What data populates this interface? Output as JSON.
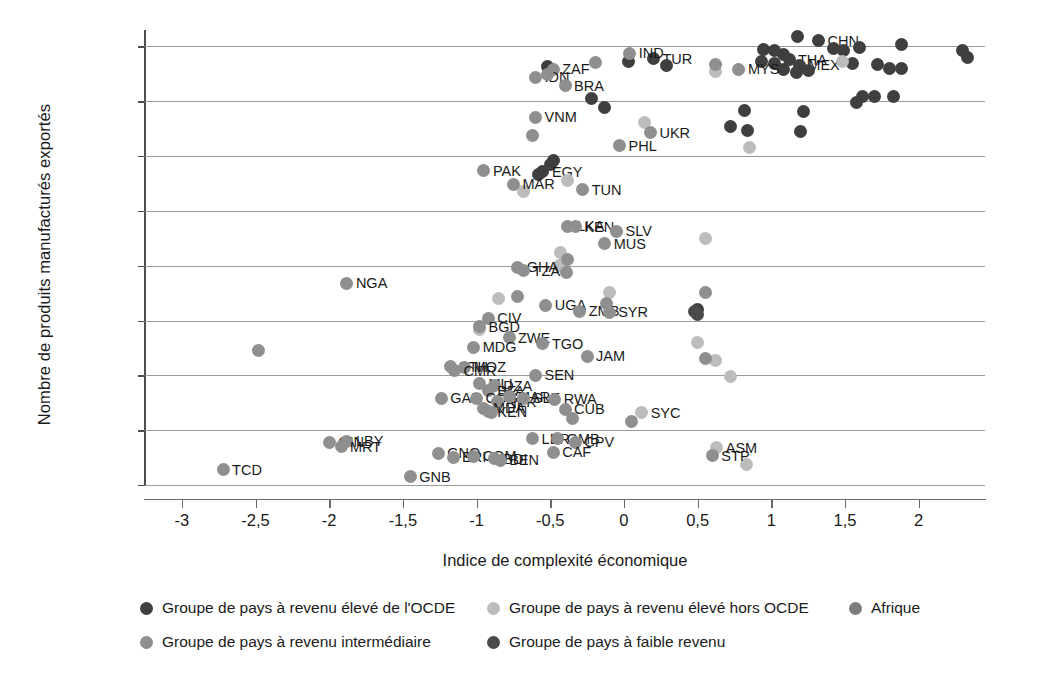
{
  "chart_data": {
    "type": "scatter",
    "title": "",
    "xlabel": "Indice de complexité économique",
    "ylabel": "Nombre de produits manufacturés exportés",
    "xlim": [
      -3.25,
      2.45
    ],
    "ylim": [
      0,
      4150
    ],
    "xticks": [
      "-3",
      "-2,5",
      "-2",
      "-1,5",
      "-1",
      "-0,5",
      "0",
      "0,5",
      "1",
      "1,5",
      "2"
    ],
    "xtick_values": [
      -3,
      -2.5,
      -2,
      -1.5,
      -1,
      -0.5,
      0,
      0.5,
      1,
      1.5,
      2
    ],
    "yticks": [
      "0",
      "500",
      "1000",
      "1500",
      "2000",
      "2500",
      "3000",
      "3500",
      "4000"
    ],
    "ytick_values": [
      0,
      500,
      1000,
      1500,
      2000,
      2500,
      3000,
      3500,
      4000
    ],
    "grid": "horizontal",
    "legend_position": "bottom",
    "colors": {
      "high_income_oecd": "#3f3f3f",
      "high_income_non_oecd": "#bcbcbc",
      "africa": "#7d7d7d",
      "middle_income": "#8f8f8f",
      "low_income": "#4a4a4a"
    },
    "series": [
      {
        "name": "Groupe de pays à revenu élevé de l'OCDE",
        "key": "high_income_oecd",
        "color": "#3f3f3f",
        "points": [
          {
            "label": "",
            "x": 1.18,
            "y": 4090
          },
          {
            "label": "CHN",
            "x": 1.32,
            "y": 4050
          },
          {
            "label": "",
            "x": 0.95,
            "y": 3975
          },
          {
            "label": "",
            "x": 1.02,
            "y": 3960
          },
          {
            "label": "",
            "x": 1.08,
            "y": 3925
          },
          {
            "label": "",
            "x": 1.42,
            "y": 3985
          },
          {
            "label": "",
            "x": 1.49,
            "y": 3965
          },
          {
            "label": "",
            "x": 1.6,
            "y": 3990
          },
          {
            "label": "",
            "x": 1.88,
            "y": 4020
          },
          {
            "label": "",
            "x": 2.3,
            "y": 3965
          },
          {
            "label": "",
            "x": 2.33,
            "y": 3900
          },
          {
            "label": "THA",
            "x": 1.12,
            "y": 3880
          },
          {
            "label": "MEX",
            "x": 1.19,
            "y": 3830
          },
          {
            "label": "",
            "x": 1.02,
            "y": 3845
          },
          {
            "label": "",
            "x": 0.93,
            "y": 3860
          },
          {
            "label": "",
            "x": 1.08,
            "y": 3790
          },
          {
            "label": "",
            "x": 1.17,
            "y": 3765
          },
          {
            "label": "",
            "x": 1.25,
            "y": 3785
          },
          {
            "label": "",
            "x": 1.55,
            "y": 3840
          },
          {
            "label": "",
            "x": 1.72,
            "y": 3835
          },
          {
            "label": "",
            "x": 1.8,
            "y": 3800
          },
          {
            "label": "",
            "x": 1.88,
            "y": 3795
          },
          {
            "label": "",
            "x": 1.62,
            "y": 3540
          },
          {
            "label": "",
            "x": 1.7,
            "y": 3545
          },
          {
            "label": "",
            "x": 1.83,
            "y": 3540
          },
          {
            "label": "",
            "x": 1.58,
            "y": 3490
          },
          {
            "label": "",
            "x": 0.82,
            "y": 3420
          },
          {
            "label": "",
            "x": 1.22,
            "y": 3405
          },
          {
            "label": "",
            "x": 0.72,
            "y": 3270
          },
          {
            "label": "",
            "x": 0.84,
            "y": 3230
          },
          {
            "label": "",
            "x": 1.2,
            "y": 3225
          },
          {
            "label": "",
            "x": 0.5,
            "y": 1600
          },
          {
            "label": "",
            "x": -0.52,
            "y": 3820
          },
          {
            "label": "",
            "x": -0.22,
            "y": 3525
          },
          {
            "label": "",
            "x": -0.13,
            "y": 3440
          },
          {
            "label": "",
            "x": -0.48,
            "y": 2960
          },
          {
            "label": "",
            "x": -0.5,
            "y": 2925
          },
          {
            "label": "TUR",
            "x": 0.2,
            "y": 3890
          },
          {
            "label": "",
            "x": 0.29,
            "y": 3830
          },
          {
            "label": "",
            "x": 0.03,
            "y": 3865
          },
          {
            "label": "EGY",
            "x": -0.55,
            "y": 2855
          },
          {
            "label": "",
            "x": -0.58,
            "y": 2830
          }
        ]
      },
      {
        "name": "Groupe de pays à revenu élevé hors OCDE",
        "key": "high_income_non_oecd",
        "color": "#bcbcbc",
        "points": [
          {
            "label": "",
            "x": 1.48,
            "y": 3865
          },
          {
            "label": "",
            "x": 0.62,
            "y": 3775
          },
          {
            "label": "",
            "x": 0.14,
            "y": 3305
          },
          {
            "label": "",
            "x": 0.85,
            "y": 3075
          },
          {
            "label": "",
            "x": -0.38,
            "y": 2780
          },
          {
            "label": "",
            "x": -0.68,
            "y": 2680
          },
          {
            "label": "",
            "x": 0.55,
            "y": 2245
          },
          {
            "label": "",
            "x": -0.43,
            "y": 2125
          },
          {
            "label": "",
            "x": -0.44,
            "y": 2000
          },
          {
            "label": "",
            "x": -0.85,
            "y": 1700
          },
          {
            "label": "",
            "x": -0.1,
            "y": 1755
          },
          {
            "label": "",
            "x": -0.98,
            "y": 1420
          },
          {
            "label": "",
            "x": 0.5,
            "y": 1300
          },
          {
            "label": "",
            "x": 0.62,
            "y": 1140
          },
          {
            "label": "",
            "x": 0.72,
            "y": 990
          },
          {
            "label": "SYC",
            "x": 0.12,
            "y": 660
          },
          {
            "label": "ASM",
            "x": 0.63,
            "y": 340
          },
          {
            "label": "",
            "x": 0.83,
            "y": 185
          }
        ]
      },
      {
        "name": "Groupe de pays à revenu intermédiaire",
        "key": "middle_income",
        "color": "#8f8f8f",
        "points": [
          {
            "label": "ZAF",
            "x": -0.48,
            "y": 3790
          },
          {
            "label": "IDN",
            "x": -0.6,
            "y": 3720
          },
          {
            "label": "",
            "x": -0.52,
            "y": 3740
          },
          {
            "label": "BRA",
            "x": -0.4,
            "y": 3640
          },
          {
            "label": "IND",
            "x": 0.04,
            "y": 3940
          },
          {
            "label": "",
            "x": -0.19,
            "y": 3855
          },
          {
            "label": "MYS",
            "x": 0.78,
            "y": 3790
          },
          {
            "label": "",
            "x": 0.62,
            "y": 3835
          },
          {
            "label": "VNM",
            "x": -0.6,
            "y": 3355
          },
          {
            "label": "",
            "x": -0.62,
            "y": 3190
          },
          {
            "label": "UKR",
            "x": 0.18,
            "y": 3215
          },
          {
            "label": "PHL",
            "x": -0.03,
            "y": 3095
          },
          {
            "label": "MAR",
            "x": -0.75,
            "y": 2745
          },
          {
            "label": "TUN",
            "x": -0.28,
            "y": 2695
          },
          {
            "label": "PAK",
            "x": -0.95,
            "y": 2865
          },
          {
            "label": "LKA",
            "x": -0.38,
            "y": 2360
          },
          {
            "label": "KEN",
            "x": -0.33,
            "y": 2355
          },
          {
            "label": "SLV",
            "x": -0.05,
            "y": 2315
          },
          {
            "label": "MUS",
            "x": -0.13,
            "y": 2200
          },
          {
            "label": "GHA",
            "x": -0.72,
            "y": 1985
          },
          {
            "label": "TZA",
            "x": -0.68,
            "y": 1955
          },
          {
            "label": "",
            "x": -0.38,
            "y": 2060
          },
          {
            "label": "",
            "x": -0.39,
            "y": 1940
          },
          {
            "label": "UGA",
            "x": -0.53,
            "y": 1640
          },
          {
            "label": "",
            "x": -0.72,
            "y": 1715
          },
          {
            "label": "ZMB",
            "x": -0.3,
            "y": 1585
          },
          {
            "label": "SYR",
            "x": -0.1,
            "y": 1575
          },
          {
            "label": "",
            "x": -0.12,
            "y": 1655
          },
          {
            "label": "CIV",
            "x": -0.92,
            "y": 1520
          },
          {
            "label": "BGD",
            "x": -0.98,
            "y": 1445
          },
          {
            "label": "ZWE",
            "x": -0.78,
            "y": 1345
          },
          {
            "label": "TGO",
            "x": -0.55,
            "y": 1290
          },
          {
            "label": "MDG",
            "x": -1.02,
            "y": 1255
          },
          {
            "label": "JAM",
            "x": -0.25,
            "y": 1175
          },
          {
            "label": "",
            "x": 0.55,
            "y": 1755
          },
          {
            "label": "",
            "x": 0.55,
            "y": 1155
          },
          {
            "label": "ETH",
            "x": -1.18,
            "y": 1080
          },
          {
            "label": "MOZ",
            "x": -1.08,
            "y": 1075
          },
          {
            "label": "CMR",
            "x": -1.15,
            "y": 1040
          },
          {
            "label": "SEN",
            "x": -0.6,
            "y": 1000
          },
          {
            "label": "MLI",
            "x": -0.98,
            "y": 925
          },
          {
            "label": "DZA",
            "x": -0.88,
            "y": 905
          },
          {
            "label": "BFA",
            "x": -0.92,
            "y": 860
          },
          {
            "label": "GAB",
            "x": -1.24,
            "y": 790
          },
          {
            "label": "COG",
            "x": -1.0,
            "y": 790
          },
          {
            "label": "NER",
            "x": -0.86,
            "y": 760
          },
          {
            "label": "MAR2",
            "x": -0.78,
            "y": 805
          },
          {
            "label": "SLE",
            "x": -0.68,
            "y": 790
          },
          {
            "label": "RWA",
            "x": -0.47,
            "y": 780
          },
          {
            "label": "CUB",
            "x": -0.4,
            "y": 690
          },
          {
            "label": "NGA",
            "x": -1.88,
            "y": 1840
          },
          {
            "label": "",
            "x": -2.48,
            "y": 1225
          },
          {
            "label": "MDA",
            "x": -0.95,
            "y": 700
          },
          {
            "label": "KEN2",
            "x": -0.92,
            "y": 670
          },
          {
            "label": "",
            "x": -0.9,
            "y": 660
          },
          {
            "label": "",
            "x": -0.35,
            "y": 610
          },
          {
            "label": "",
            "x": 0.05,
            "y": 580
          },
          {
            "label": "LBR",
            "x": -0.62,
            "y": 420
          },
          {
            "label": "GMB",
            "x": -0.45,
            "y": 420
          },
          {
            "label": "CPV",
            "x": -0.33,
            "y": 390
          },
          {
            "label": "CAF",
            "x": -0.48,
            "y": 300
          },
          {
            "label": "GNQ",
            "x": -1.26,
            "y": 290
          },
          {
            "label": "ERI",
            "x": -1.16,
            "y": 255
          },
          {
            "label": "COM",
            "x": -1.02,
            "y": 260
          },
          {
            "label": "BDI",
            "x": -0.88,
            "y": 240
          },
          {
            "label": "BEN",
            "x": -0.84,
            "y": 225
          },
          {
            "label": "GNB",
            "x": -1.45,
            "y": 75
          },
          {
            "label": "GIN",
            "x": -2.0,
            "y": 390
          },
          {
            "label": "LBY",
            "x": -1.88,
            "y": 400
          },
          {
            "label": "MRT",
            "x": -1.92,
            "y": 350
          },
          {
            "label": "TCD",
            "x": -2.72,
            "y": 140
          },
          {
            "label": "STP",
            "x": 0.6,
            "y": 265
          }
        ]
      },
      {
        "name": "Groupe de pays à faible revenu",
        "key": "low_income",
        "color": "#4a4a4a",
        "points": [
          {
            "label": "",
            "x": 0.48,
            "y": 1580
          },
          {
            "label": "",
            "x": 0.5,
            "y": 1555
          }
        ]
      },
      {
        "name": "Afrique",
        "key": "africa",
        "color": "#7d7d7d",
        "points": []
      }
    ]
  },
  "legend": {
    "items": [
      {
        "label": "Groupe de pays à revenu élevé de l'OCDE",
        "color": "#3f3f3f",
        "row": 0,
        "left": 140
      },
      {
        "label": "Groupe de pays à revenu élevé hors OCDE",
        "color": "#bcbcbc",
        "row": 0,
        "left": 487
      },
      {
        "label": "Afrique",
        "color": "#7d7d7d",
        "row": 0,
        "left": 849
      },
      {
        "label": "Groupe de pays à revenu intermédiaire",
        "color": "#8f8f8f",
        "row": 1,
        "left": 140
      },
      {
        "label": "Groupe de pays à faible revenu",
        "color": "#4a4a4a",
        "row": 1,
        "left": 487
      }
    ]
  }
}
